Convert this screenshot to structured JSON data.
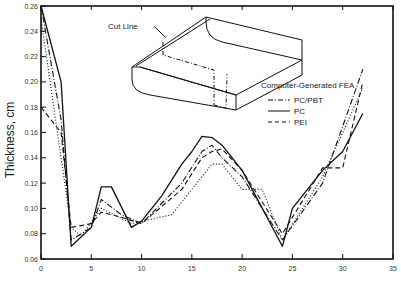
{
  "chart_data": {
    "type": "line",
    "title": "",
    "xlabel": "",
    "ylabel": "Thickness, cm",
    "xlim": [
      0,
      35
    ],
    "ylim": [
      0.06,
      0.26
    ],
    "x_ticks": [
      "0",
      "5",
      "10",
      "15",
      "20",
      "25",
      "30",
      "35"
    ],
    "y_ticks": [
      "0.06",
      "0.08",
      "0.10",
      "0.12",
      "0.14",
      "0.16",
      "0.18",
      "0.20",
      "0.22",
      "0.24",
      "0.26"
    ],
    "grid": false,
    "legend_position": "upper right (inside plot)",
    "legend_title": "Computer-Generated FEA",
    "series": [
      {
        "name": "Computer-Generated FEA",
        "style": "dotted",
        "x": [
          0,
          2,
          3,
          4,
          6,
          9,
          13,
          16,
          17,
          18,
          20,
          22,
          24,
          28,
          32
        ],
        "values": [
          0.25,
          0.14,
          0.085,
          0.078,
          0.1,
          0.088,
          0.095,
          0.125,
          0.135,
          0.135,
          0.115,
          0.115,
          0.075,
          0.125,
          0.195
        ]
      },
      {
        "name": "PC/PBT",
        "style": "dash-dot",
        "x": [
          0,
          2,
          3,
          5,
          6,
          8,
          10,
          14,
          16,
          17,
          18,
          20,
          24,
          28,
          32
        ],
        "values": [
          0.26,
          0.17,
          0.075,
          0.085,
          0.107,
          0.095,
          0.088,
          0.12,
          0.145,
          0.15,
          0.14,
          0.125,
          0.075,
          0.12,
          0.21
        ]
      },
      {
        "name": "PC",
        "style": "solid",
        "x": [
          0,
          2,
          3,
          5,
          6,
          7,
          9,
          10,
          12,
          14,
          15,
          16,
          17,
          18,
          20,
          24,
          25,
          28,
          30,
          32
        ],
        "values": [
          0.26,
          0.2,
          0.07,
          0.085,
          0.117,
          0.117,
          0.085,
          0.09,
          0.11,
          0.135,
          0.145,
          0.157,
          0.156,
          0.15,
          0.13,
          0.07,
          0.1,
          0.13,
          0.145,
          0.175
        ]
      },
      {
        "name": "PEI",
        "style": "dashed",
        "x": [
          0,
          2,
          3,
          5,
          6,
          8,
          10,
          14,
          16,
          17,
          18,
          20,
          24,
          28,
          30,
          32
        ],
        "values": [
          0.18,
          0.16,
          0.085,
          0.088,
          0.097,
          0.093,
          0.088,
          0.115,
          0.14,
          0.145,
          0.147,
          0.13,
          0.08,
          0.132,
          0.132,
          0.2
        ]
      }
    ],
    "annotations": [
      {
        "text": "Cut Line",
        "location": "inset part drawing, upper-left"
      }
    ]
  },
  "legend": {
    "title": "Computer-Generated FEA",
    "items": [
      {
        "label": "PC/PBT",
        "style": "dash-dot"
      },
      {
        "label": "PC",
        "style": "solid"
      },
      {
        "label": "PEI",
        "style": "dashed"
      }
    ]
  },
  "inset": {
    "label": "Cut Line",
    "icon": "box-part-drawing-icon"
  },
  "axes": {
    "ylabel": "Thickness, cm"
  }
}
